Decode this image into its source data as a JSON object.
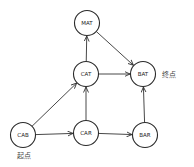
{
  "diagram": {
    "type": "directed-graph",
    "nodes": [
      {
        "id": "MAT",
        "label": "MAT"
      },
      {
        "id": "CAT",
        "label": "CAT"
      },
      {
        "id": "BAT",
        "label": "BAT"
      },
      {
        "id": "CAB",
        "label": "CAB"
      },
      {
        "id": "CAR",
        "label": "CAR"
      },
      {
        "id": "BAR",
        "label": "BAR"
      }
    ],
    "edges": [
      {
        "from": "CAB",
        "to": "CAT"
      },
      {
        "from": "CAB",
        "to": "CAR"
      },
      {
        "from": "CAR",
        "to": "CAT"
      },
      {
        "from": "CAR",
        "to": "BAR"
      },
      {
        "from": "CAT",
        "to": "MAT"
      },
      {
        "from": "CAT",
        "to": "BAT"
      },
      {
        "from": "MAT",
        "to": "BAT"
      },
      {
        "from": "BAR",
        "to": "BAT"
      }
    ],
    "annotations": {
      "start": {
        "node": "CAB",
        "text": "起点"
      },
      "end": {
        "node": "BAT",
        "text": "终点"
      }
    }
  }
}
